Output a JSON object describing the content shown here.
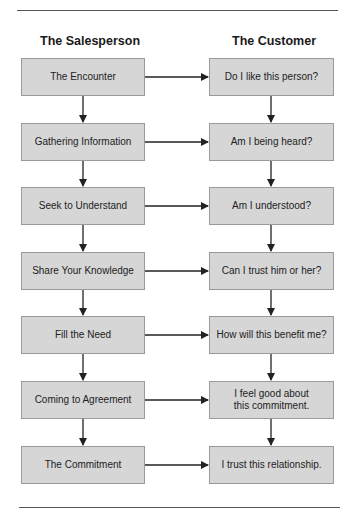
{
  "headers": {
    "salesperson": "The Salesperson",
    "customer": "The Customer"
  },
  "salesperson_steps": [
    "The Encounter",
    "Gathering Information",
    "Seek to Understand",
    "Share Your Knowledge",
    "Fill the Need",
    "Coming to Agreement",
    "The Commitment"
  ],
  "customer_responses": [
    "Do I like this person?",
    "Am I being heard?",
    "Am I understood?",
    "Can I trust him or her?",
    "How will this benefit me?",
    "I feel good about\nthis commitment.",
    "I trust this relationship."
  ],
  "colors": {
    "box_fill": "#d6d6d6",
    "box_border": "#9a9a9a",
    "arrow": "#222222",
    "rule": "#555555"
  }
}
